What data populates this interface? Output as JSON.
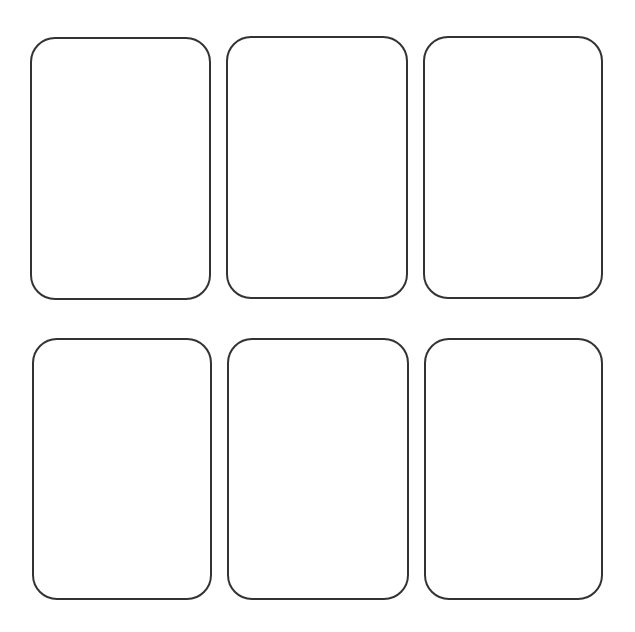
{
  "layout": {
    "rows": 2,
    "columns": 3,
    "background": "#ffffff",
    "stroke_color": "#333333",
    "stroke_width": 2,
    "corner_radius": 25
  },
  "cards": [
    {
      "id": "card-1",
      "x": 30,
      "y": 37,
      "w": 181,
      "h": 263
    },
    {
      "id": "card-2",
      "x": 226,
      "y": 36,
      "w": 182,
      "h": 263
    },
    {
      "id": "card-3",
      "x": 423,
      "y": 36,
      "w": 180,
      "h": 263
    },
    {
      "id": "card-4",
      "x": 32,
      "y": 338,
      "w": 180,
      "h": 262
    },
    {
      "id": "card-5",
      "x": 227,
      "y": 338,
      "w": 182,
      "h": 262
    },
    {
      "id": "card-6",
      "x": 424,
      "y": 338,
      "w": 179,
      "h": 262
    }
  ]
}
